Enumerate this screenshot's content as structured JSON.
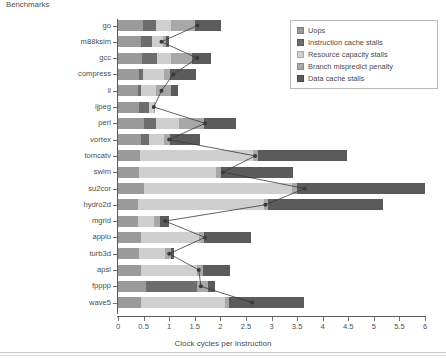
{
  "chart_data": {
    "type": "bar",
    "orientation": "horizontal",
    "stacked": true,
    "title": "",
    "xlabel": "Clock cycles per instruction",
    "ylabel": "Benchmarks",
    "xlim": [
      0,
      6
    ],
    "xticks": [
      0,
      0.5,
      1,
      1.5,
      2,
      2.5,
      3,
      3.5,
      4,
      4.5,
      5,
      5.5,
      6
    ],
    "xtick_labels": [
      "0",
      "0.5",
      "1",
      "1.5",
      "2",
      "2.5",
      "3",
      "3.5",
      "4",
      "4.5",
      "5",
      "5.5",
      "6"
    ],
    "grid": false,
    "legend_position": "top-right",
    "categories": [
      "go",
      "m88ksim",
      "gcc",
      "compress",
      "li",
      "ijpeg",
      "perl",
      "vortex",
      "tomcatv",
      "swim",
      "su2cor",
      "hydro2d",
      "mgrid",
      "applu",
      "turb3d",
      "apsi",
      "fpppp",
      "wave5"
    ],
    "series": [
      {
        "name": "Uops",
        "color": "#9a9a9a",
        "values": [
          0.48,
          0.44,
          0.46,
          0.42,
          0.4,
          0.42,
          0.5,
          0.44,
          0.43,
          0.42,
          0.5,
          0.4,
          0.4,
          0.44,
          0.42,
          0.44,
          0.55,
          0.44
        ]
      },
      {
        "name": "Instruction cache stalls",
        "color": "#6d6d6d",
        "values": [
          0.26,
          0.22,
          0.3,
          0.06,
          0.05,
          0.18,
          0.24,
          0.16,
          0.0,
          0.0,
          0.0,
          0.0,
          0.0,
          0.0,
          0.0,
          0.0,
          1.0,
          0.0
        ]
      },
      {
        "name": "Resource capacity stalls",
        "color": "#cfcfcf",
        "values": [
          0.3,
          0.22,
          0.28,
          0.42,
          0.3,
          0.1,
          0.45,
          0.3,
          2.2,
          1.5,
          2.9,
          2.45,
          0.3,
          1.15,
          0.5,
          1.1,
          0.0,
          1.65
        ]
      },
      {
        "name": "Branch mispredict penalty",
        "color": "#a8a8a8",
        "values": [
          0.46,
          0.06,
          0.4,
          0.12,
          0.28,
          0.02,
          0.5,
          0.12,
          0.1,
          0.1,
          0.1,
          0.08,
          0.12,
          0.1,
          0.12,
          0.12,
          0.2,
          0.08
        ]
      },
      {
        "name": "Data cache stalls",
        "color": "#5b5b5b",
        "values": [
          0.52,
          0.06,
          0.37,
          0.5,
          0.14,
          0.0,
          0.62,
          0.58,
          1.75,
          1.4,
          2.5,
          2.25,
          0.18,
          0.9,
          0.06,
          0.52,
          0.15,
          1.47
        ]
      }
    ],
    "marker_series": {
      "name": "CPI marker",
      "color": "#3a3a3a",
      "values": [
        1.55,
        0.85,
        1.55,
        1.08,
        0.85,
        0.7,
        1.7,
        1.0,
        2.68,
        2.05,
        3.65,
        2.88,
        0.92,
        1.7,
        1.0,
        1.58,
        1.62,
        2.62
      ]
    }
  },
  "legend": {
    "items": [
      {
        "label": "Uops",
        "swatch": "legend-swatch-uops"
      },
      {
        "label": "Instruction cache stalls",
        "swatch": "legend-swatch-icache"
      },
      {
        "label": "Resource capacity stalls",
        "swatch": "legend-swatch-resource"
      },
      {
        "label": "Branch mispredict penalty",
        "swatch": "legend-swatch-branch"
      },
      {
        "label": "Data cache stalls",
        "swatch": "legend-swatch-dcache"
      }
    ]
  }
}
